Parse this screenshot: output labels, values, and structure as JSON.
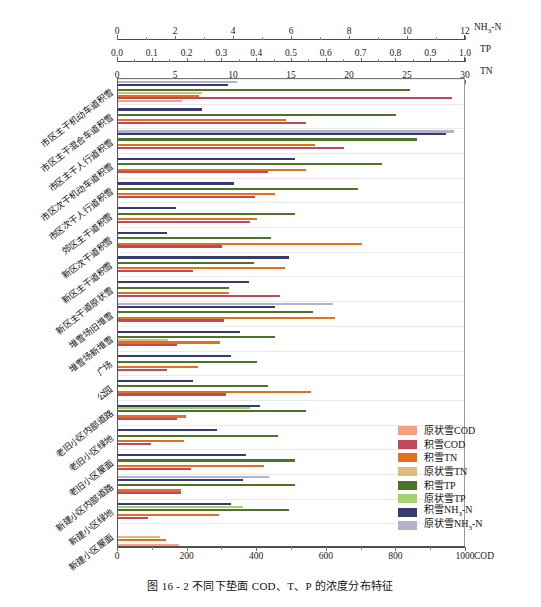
{
  "figure": {
    "caption": "图 16 - 2   不同下垫面 COD、T、P 的浓度分布特征"
  },
  "axes": {
    "nh3n": {
      "name": "NH3-N",
      "name_base": "NH",
      "name_sub": "3",
      "name_tail": "-N",
      "min": 0,
      "max": 12,
      "ticks": [
        0,
        2,
        4,
        6,
        8,
        10,
        12
      ],
      "tick_labels": [
        "0",
        "2",
        "4",
        "6",
        "8",
        "10",
        "12"
      ]
    },
    "tp": {
      "name": "TP",
      "min": 0,
      "max": 1.0,
      "ticks": [
        0,
        0.1,
        0.2,
        0.3,
        0.4,
        0.5,
        0.6,
        0.7,
        0.8,
        0.9,
        1.0
      ],
      "tick_labels": [
        "0.0",
        "0.1",
        "0.2",
        "0.3",
        "0.4",
        "0.5",
        "0.6",
        "0.7",
        "0.8",
        "0.9",
        "1.0"
      ]
    },
    "tn": {
      "name": "TN",
      "min": 0,
      "max": 30,
      "ticks": [
        0,
        5,
        10,
        15,
        20,
        25,
        30
      ],
      "tick_labels": [
        "0",
        "5",
        "10",
        "15",
        "20",
        "25",
        "30"
      ]
    },
    "cod": {
      "name": "COD",
      "min": 0,
      "max": 1000,
      "ticks": [
        0,
        200,
        400,
        600,
        800,
        1000
      ],
      "tick_labels": [
        "0",
        "200",
        "400",
        "600",
        "800",
        "1000"
      ]
    }
  },
  "legend": {
    "position": "inside-bottom-right",
    "items": [
      {
        "label": "原状雪COD",
        "color": "#f2a183",
        "key": "yuan_cod"
      },
      {
        "label": "积雪COD",
        "color": "#c0485c",
        "key": "ji_cod"
      },
      {
        "label": "积雪TN",
        "color": "#e2701e",
        "key": "ji_tn"
      },
      {
        "label": "原状雪TN",
        "color": "#ddbb79",
        "key": "yuan_tn"
      },
      {
        "label": "积雪TP",
        "color": "#4d7327",
        "key": "ji_tp"
      },
      {
        "label": "原状雪TP",
        "color": "#a6d06b",
        "key": "yuan_tp"
      },
      {
        "label": "积雪NH3-N",
        "color": "#393a6e",
        "key": "ji_nh3n",
        "has_sub": true,
        "pre": "积雪NH",
        "sub": "3",
        "post": "-N"
      },
      {
        "label": "原状雪NH3-N",
        "color": "#b3b2c6",
        "key": "yuan_nh3n",
        "has_sub": true,
        "pre": "原状雪NH",
        "sub": "3",
        "post": "-N"
      }
    ]
  },
  "chart_data": {
    "type": "bar",
    "orientation": "horizontal",
    "title": "不同下垫面 COD、T、P 的浓度分布特征",
    "xlabel": "",
    "ylabel": "",
    "grid": true,
    "note": "Four independent x scales; each series is plotted against its own axis (COD 0-1000 bottom, TN 0-30, TP 0-1.0, NH3-N 0-12 top).",
    "categories": [
      "市区主干机动车道积雪",
      "市区主干混合车道积雪",
      "市区主干人行道积雪",
      "市区次干机动车道积雪",
      "市区次干人行道积雪",
      "郊区主干道积雪",
      "新区次干道积雪",
      "新区主干道积雪",
      "新区主干道原状雪",
      "堆雪场旧堆雪",
      "堆雪场新堆雪",
      "广场",
      "公园",
      "老旧小区内部道路",
      "老旧小区绿地",
      "老旧小区屋面",
      "新建小区内部道路",
      "新建小区绿地",
      "新建小区屋面"
    ],
    "series": [
      {
        "name": "原状雪NH3-N",
        "axis": "nh3n",
        "color": "#b3b2c6",
        "values": [
          4.1,
          0.0,
          11.6,
          0.0,
          0.0,
          0.0,
          0.0,
          0.0,
          0.0,
          7.4,
          0.0,
          0.0,
          0.0,
          0.0,
          0.0,
          0.0,
          5.2,
          0.0,
          0.0
        ]
      },
      {
        "name": "积雪NH3-N",
        "axis": "nh3n",
        "color": "#393a6e",
        "values": [
          3.8,
          2.9,
          11.3,
          6.1,
          4.0,
          2.0,
          1.7,
          5.9,
          4.5,
          5.4,
          4.2,
          3.9,
          2.6,
          4.9,
          3.4,
          4.4,
          4.3,
          3.9,
          0.0
        ]
      },
      {
        "name": "原状雪TP",
        "axis": "tp",
        "color": "#a6d06b",
        "values": [
          0.0,
          0.0,
          0.0,
          0.0,
          0.0,
          0.0,
          0.0,
          0.0,
          0.0,
          0.0,
          0.0,
          0.0,
          0.0,
          0.38,
          0.0,
          0.0,
          0.0,
          0.36,
          0.0
        ]
      },
      {
        "name": "积雪TP",
        "axis": "tp",
        "color": "#4d7327",
        "values": [
          0.84,
          0.8,
          0.86,
          0.76,
          0.69,
          0.51,
          0.44,
          0.39,
          0.32,
          0.56,
          0.45,
          0.4,
          0.43,
          0.54,
          0.46,
          0.51,
          0.51,
          0.49,
          0.0
        ]
      },
      {
        "name": "原状雪TN",
        "axis": "tn",
        "color": "#ddbb79",
        "values": [
          7.2,
          0.0,
          0.0,
          0.0,
          0.0,
          0.0,
          0.0,
          0.0,
          0.0,
          0.0,
          4.3,
          0.0,
          0.0,
          0.0,
          0.0,
          0.0,
          0.0,
          0.0,
          3.6
        ]
      },
      {
        "name": "积雪TN",
        "axis": "tn",
        "color": "#e2701e",
        "values": [
          7.0,
          14.5,
          17.0,
          16.2,
          13.5,
          12.0,
          21.0,
          14.4,
          9.6,
          18.7,
          8.8,
          6.9,
          16.6,
          5.9,
          5.7,
          12.6,
          5.4,
          8.7,
          4.1
        ]
      },
      {
        "name": "积雪COD",
        "axis": "cod",
        "color": "#c0485c",
        "values": [
          960,
          540,
          650,
          430,
          395,
          380,
          300,
          215,
          465,
          305,
          170,
          140,
          310,
          170,
          95,
          210,
          180,
          85,
          0
        ]
      },
      {
        "name": "原状雪COD",
        "axis": "cod",
        "color": "#f2a183",
        "values": [
          185,
          0,
          0,
          0,
          0,
          0,
          0,
          0,
          0,
          0,
          0,
          0,
          0,
          0,
          0,
          0,
          0,
          0,
          175
        ]
      }
    ]
  }
}
